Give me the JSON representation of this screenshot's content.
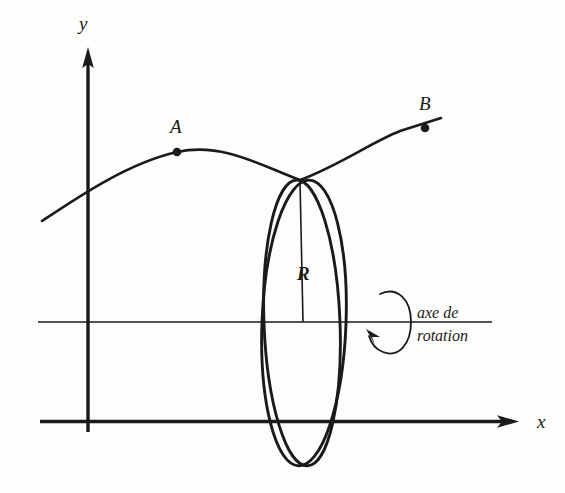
{
  "figure": {
    "background_color": "#fdfdfb",
    "ink_color": "#1a1a1a",
    "axes": {
      "y_axis": {
        "label": "y",
        "name": "y-axis",
        "direction": "up",
        "arrow": true
      },
      "x_axis": {
        "label": "x",
        "name": "x-axis",
        "direction": "right",
        "arrow": true
      },
      "rotation_axis": {
        "name": "axis-of-rotation",
        "label_line1": "axe de",
        "label_line2": "rotation",
        "arrow": true
      }
    },
    "curve": {
      "name": "generating-curve",
      "description": "courbe generatrice"
    },
    "points": [
      {
        "label": "A",
        "name": "point-a"
      },
      {
        "label": "B",
        "name": "point-b"
      }
    ],
    "circle": {
      "name": "revolution-circle",
      "radius_label": "R",
      "count": 2
    }
  }
}
